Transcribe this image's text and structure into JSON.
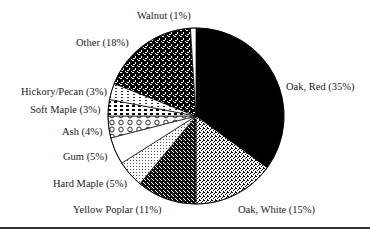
{
  "chart_data": {
    "type": "pie",
    "title": "",
    "start_angle_deg": 0,
    "direction": "clockwise",
    "slices": [
      {
        "label": "Oak, Red",
        "value": 35,
        "display": "Oak, Red (35%)",
        "fill": "#000000",
        "pattern": "solid"
      },
      {
        "label": "Oak, White",
        "value": 15,
        "display": "Oak, White (15%)",
        "fill": "#9a9a9a",
        "pattern": "fine-speckle"
      },
      {
        "label": "Yellow Poplar",
        "value": 11,
        "display": "Yellow Poplar (11%)",
        "fill": "#3a3a3a",
        "pattern": "dark-speckle"
      },
      {
        "label": "Hard Maple",
        "value": 5,
        "display": "Hard Maple (5%)",
        "fill": "#dcdcdc",
        "pattern": "light-stipple"
      },
      {
        "label": "Gum",
        "value": 5,
        "display": "Gum (5%)",
        "fill": "#ffffff",
        "pattern": "none"
      },
      {
        "label": "Ash",
        "value": 4,
        "display": "Ash (4%)",
        "fill": "#f0f0f0",
        "pattern": "loops"
      },
      {
        "label": "Soft Maple",
        "value": 3,
        "display": "Soft Maple (3%)",
        "fill": "#606060",
        "pattern": "dashes"
      },
      {
        "label": "Hickory/Pecan",
        "value": 3,
        "display": "Hickory/Pecan (3%)",
        "fill": "#d6d6d6",
        "pattern": "light-dashes"
      },
      {
        "label": "Other",
        "value": 18,
        "display": "Other (18%)",
        "fill": "#1a1a1a",
        "pattern": "coarse-checker"
      },
      {
        "label": "Walnut",
        "value": 1,
        "display": "Walnut (1%)",
        "fill": "#ffffff",
        "pattern": "none"
      }
    ],
    "legend": "none (labels placed around pie)",
    "units": "%"
  },
  "labels": {
    "oak_red": "Oak, Red (35%)",
    "oak_white": "Oak, White (15%)",
    "yellow_poplar": "Yellow Poplar (11%)",
    "hard_maple": "Hard Maple (5%)",
    "gum": "Gum (5%)",
    "ash": "Ash (4%)",
    "soft_maple": "Soft Maple (3%)",
    "hickory_pecan": "Hickory/Pecan (3%)",
    "other": "Other (18%)",
    "walnut": "Walnut (1%)"
  }
}
